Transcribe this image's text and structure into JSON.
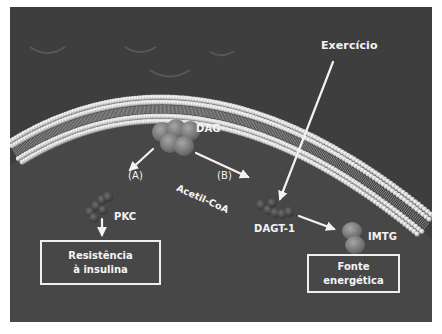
{
  "diagram": {
    "colors": {
      "outside": "#3e3e3e",
      "cytoplasm": "#484848",
      "membrane_bead": "#d8d8d8",
      "text": "#f4f4f4",
      "arrow": "#f2f2f2"
    },
    "labels": {
      "exercise": "Exercício",
      "dag": "DAG",
      "path_a": "(A)",
      "path_b": "(B)",
      "acetyl_coa": "Acetil-CoA",
      "pkc": "PKC",
      "dagt1": "DAGT-1",
      "imtg": "IMTG"
    },
    "boxes": {
      "insulin_resistance": [
        "Resistência",
        "à insulina"
      ],
      "energy_source": [
        "Fonte",
        "energética"
      ]
    }
  }
}
